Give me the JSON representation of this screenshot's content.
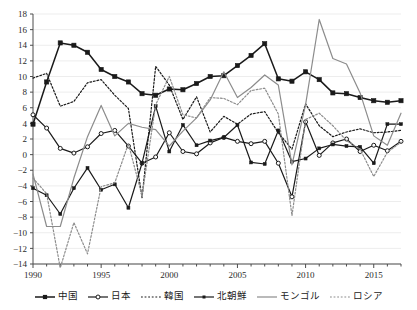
{
  "chart_data": {
    "type": "line",
    "title": "",
    "xlabel": "",
    "ylabel": "",
    "xlim": [
      1990,
      2017
    ],
    "ylim": [
      -14,
      18
    ],
    "ytick_step": 2,
    "grid": true,
    "legend_position": "bottom",
    "x": [
      1990,
      1991,
      1992,
      1993,
      1994,
      1995,
      1996,
      1997,
      1998,
      1999,
      2000,
      2001,
      2002,
      2003,
      2004,
      2005,
      2006,
      2007,
      2008,
      2009,
      2010,
      2011,
      2012,
      2013,
      2014,
      2015,
      2016,
      2017
    ],
    "xticks": [
      1990,
      1995,
      2000,
      2005,
      2010,
      2015
    ],
    "xtick_labels": [
      "1990",
      "1995",
      "2000",
      "2005",
      "2010",
      "2015"
    ],
    "yticks": [
      -14,
      -12,
      -10,
      -8,
      -6,
      -4,
      -2,
      0,
      2,
      4,
      6,
      8,
      10,
      12,
      14,
      16,
      18
    ],
    "ytick_labels": [
      "−14",
      "−12",
      "−10",
      "−8",
      "−6",
      "−4",
      "−2",
      "0",
      "2",
      "4",
      "6",
      "8",
      "10",
      "12",
      "14",
      "16",
      "18"
    ],
    "series": [
      {
        "name": "中国",
        "key": "china",
        "color": "#1a1a1a",
        "style": "solid",
        "marker": "filled-square",
        "values": [
          3.9,
          9.3,
          14.3,
          14.0,
          13.1,
          10.9,
          10.0,
          9.3,
          7.8,
          7.6,
          8.4,
          8.3,
          9.1,
          10.0,
          10.1,
          11.4,
          12.7,
          14.2,
          9.7,
          9.4,
          10.6,
          9.6,
          7.9,
          7.8,
          7.3,
          6.9,
          6.7,
          6.9
        ]
      },
      {
        "name": "日本",
        "key": "japan",
        "color": "#1a1a1a",
        "style": "solid",
        "marker": "open-circle",
        "values": [
          5.1,
          3.4,
          0.8,
          0.2,
          1.0,
          2.7,
          3.1,
          1.1,
          -1.1,
          -0.3,
          2.8,
          0.4,
          0.1,
          1.5,
          2.2,
          1.7,
          1.4,
          1.7,
          -1.1,
          -5.4,
          4.2,
          -0.1,
          1.5,
          2.0,
          0.4,
          1.2,
          0.5,
          1.7
        ]
      },
      {
        "name": "韓国",
        "key": "korea",
        "color": "#1a1a1a",
        "style": "dotted",
        "marker": "none",
        "values": [
          9.8,
          10.4,
          6.2,
          6.8,
          9.2,
          9.6,
          7.6,
          5.9,
          -5.5,
          11.3,
          8.9,
          4.5,
          7.4,
          2.9,
          4.9,
          3.9,
          5.2,
          5.5,
          2.8,
          0.7,
          6.5,
          3.7,
          2.3,
          2.9,
          3.3,
          2.8,
          2.9,
          3.1
        ]
      },
      {
        "name": "北朝鮮",
        "key": "north_korea",
        "color": "#1a1a1a",
        "style": "solid",
        "marker": "small-square",
        "values": [
          -4.3,
          -5.2,
          -7.6,
          -4.3,
          -1.7,
          -4.5,
          -3.8,
          -6.8,
          -1.1,
          6.2,
          0.4,
          3.8,
          1.2,
          1.8,
          2.2,
          3.8,
          -1.0,
          -1.2,
          3.1,
          -0.9,
          -0.5,
          0.8,
          1.3,
          1.1,
          1.0,
          -1.1,
          3.9,
          3.9
        ]
      },
      {
        "name": "モンゴル",
        "key": "mongolia",
        "color": "#8c8c8c",
        "style": "solid",
        "marker": "none",
        "values": [
          -2.5,
          -9.2,
          -9.2,
          -3.0,
          2.3,
          6.3,
          2.4,
          4.0,
          3.5,
          3.2,
          1.1,
          3.0,
          4.7,
          7.0,
          10.6,
          7.3,
          8.6,
          10.2,
          8.9,
          -1.3,
          6.4,
          17.3,
          12.3,
          11.6,
          7.9,
          2.4,
          1.2,
          5.3
        ]
      },
      {
        "name": "ロシア",
        "key": "russia",
        "color": "#8c8c8c",
        "style": "dotted",
        "marker": "none",
        "values": [
          -3.0,
          -5.0,
          -14.5,
          -8.7,
          -12.7,
          -4.1,
          -3.6,
          1.4,
          -5.3,
          6.4,
          10.0,
          5.1,
          4.7,
          7.3,
          7.2,
          6.4,
          8.2,
          8.5,
          5.2,
          -7.8,
          4.5,
          5.3,
          3.7,
          1.8,
          0.7,
          -2.8,
          0.3,
          1.6
        ]
      }
    ]
  },
  "legend": {
    "items": [
      {
        "label": "中国",
        "key": "china"
      },
      {
        "label": "日本",
        "key": "japan"
      },
      {
        "label": "韓国",
        "key": "korea"
      },
      {
        "label": "北朝鮮",
        "key": "north_korea"
      },
      {
        "label": "モンゴル",
        "key": "mongolia"
      },
      {
        "label": "ロシア",
        "key": "russia"
      }
    ]
  },
  "colors": {
    "axis": "#4d4d4d",
    "grid": "#ededed",
    "black_series": "#1a1a1a",
    "gray_series": "#8c8c8c",
    "background": "#ffffff"
  }
}
